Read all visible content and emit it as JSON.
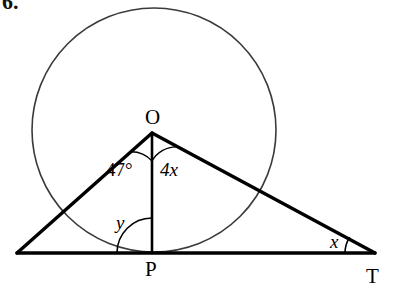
{
  "figure": {
    "problem_number": "6.",
    "stroke_color": "#000000",
    "circle_color": "#3a3a3a",
    "background": "#ffffff",
    "points": [
      {
        "key": "O",
        "label": "O",
        "x": 152,
        "y": 133,
        "label_x": 145,
        "label_y": 107
      },
      {
        "key": "P",
        "label": "P",
        "x": 152,
        "y": 253,
        "label_x": 145,
        "label_y": 259
      },
      {
        "key": "T",
        "label": "T",
        "x": 375,
        "y": 253,
        "label_x": 366,
        "label_y": 266
      },
      {
        "key": "L",
        "label": "",
        "x": 17,
        "y": 253,
        "label_x": 0,
        "label_y": 0
      }
    ],
    "angles": [
      {
        "key": "angle-at-O-left",
        "label": "47°",
        "label_x": 106,
        "label_y": 160,
        "vertex": "O",
        "arc_radius": 28
      },
      {
        "key": "angle-at-O-right",
        "label": "4x",
        "label_x": 160,
        "label_y": 160,
        "vertex": "O",
        "arc_radius": 28
      },
      {
        "key": "angle-at-P",
        "label": "y",
        "label_x": 116,
        "label_y": 213,
        "vertex": "P",
        "arc_radius": 35
      },
      {
        "key": "angle-at-T",
        "label": "x",
        "label_x": 330,
        "label_y": 232,
        "vertex": "T",
        "arc_radius": 30
      }
    ],
    "circle": {
      "center_x": 154,
      "center_y": 130,
      "radius": 122
    }
  }
}
